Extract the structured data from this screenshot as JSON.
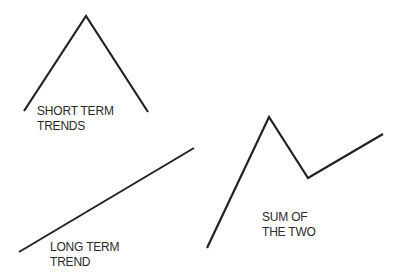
{
  "diagram": {
    "line_color": "#222222",
    "panels": [
      {
        "id": "short-term",
        "label_lines": [
          "SHORT TERM",
          "TRENDS"
        ],
        "points": [
          [
            24,
            111
          ],
          [
            86,
            16
          ],
          [
            148,
            112
          ]
        ]
      },
      {
        "id": "long-term",
        "label_lines": [
          "LONG TERM",
          "TREND"
        ],
        "points": [
          [
            19,
            252
          ],
          [
            194,
            148
          ]
        ]
      },
      {
        "id": "sum",
        "label_lines": [
          "SUM OF",
          "THE TWO"
        ],
        "points": [
          [
            207,
            248
          ],
          [
            269,
            117
          ],
          [
            308,
            178
          ],
          [
            383,
            134
          ]
        ]
      }
    ]
  }
}
